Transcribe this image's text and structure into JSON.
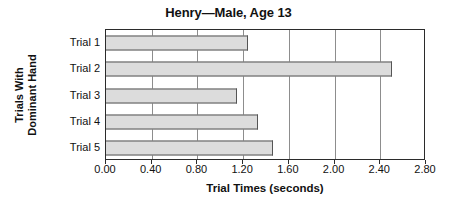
{
  "chart_data": {
    "type": "bar",
    "orientation": "horizontal",
    "title": "Henry—Male, Age 13",
    "xlabel": "Trial Times (seconds)",
    "ylabel_lines": [
      "Trials With",
      "Dominant Hand"
    ],
    "ylabel": "Trials With Dominant Hand",
    "categories": [
      "Trial 1",
      "Trial 2",
      "Trial 3",
      "Trial 4",
      "Trial 5"
    ],
    "values": [
      1.24,
      2.5,
      1.15,
      1.33,
      1.46
    ],
    "xlim": [
      0.0,
      2.8
    ],
    "xticks": [
      0.0,
      0.4,
      0.8,
      1.2,
      1.6,
      2.0,
      2.4,
      2.8
    ],
    "xtick_labels": [
      "0.00",
      "0.40",
      "0.80",
      "1.20",
      "1.60",
      "2.00",
      "2.40",
      "2.80"
    ],
    "grid": "vertical",
    "legend": "none",
    "bar_fill_color": "#dcdcdc",
    "bar_border_color": "#555555",
    "gridline_color": "#8d8d8d",
    "axis_color": "#2b2b2b"
  }
}
